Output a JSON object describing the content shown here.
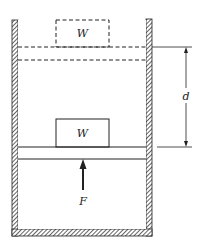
{
  "diagram": {
    "title": "",
    "labels": {
      "weight_initial": "W",
      "weight_final": "W",
      "force": "F",
      "displacement": "d"
    },
    "colors": {
      "line": "#222222",
      "background": "#ffffff"
    }
  }
}
